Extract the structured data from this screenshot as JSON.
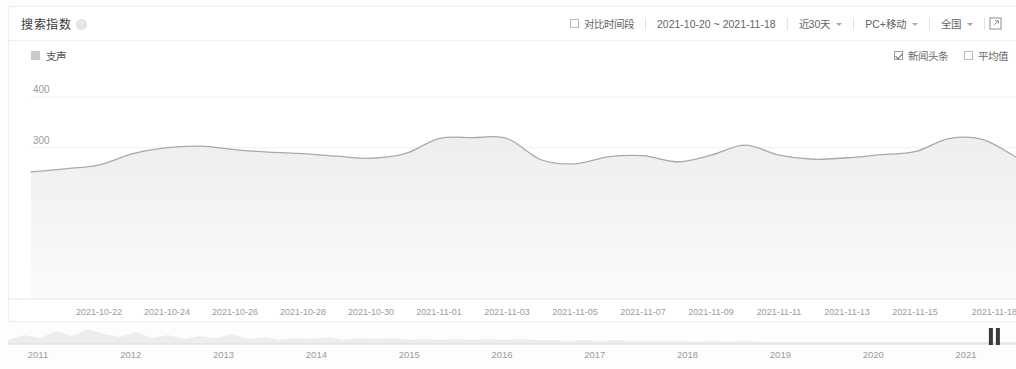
{
  "header": {
    "title": "搜索指数",
    "help_icon": "help-circle-icon",
    "compare_label": "对比时间段",
    "compare_checked": false,
    "date_range": "2021-10-20 ~ 2021-11-18",
    "period_label": "近30天",
    "device_label": "PC+移动",
    "region_label": "全国",
    "share_icon": "external-link-icon"
  },
  "legend": {
    "series_label": "支声",
    "news_label": "新闻头条",
    "news_checked": true,
    "average_label": "平均值",
    "average_checked": false
  },
  "colors": {
    "line": "#a9a9a9",
    "area_top": "#f2f2f2",
    "area_bottom": "#fafafa",
    "grid": "#f0f0f0",
    "axis_text": "#9b9b9b",
    "card_border": "#ececec"
  },
  "brush": {
    "years": [
      "2011",
      "2012",
      "2013",
      "2014",
      "2015",
      "2016",
      "2017",
      "2018",
      "2019",
      "2020",
      "2021"
    ],
    "handle_position_pct": 98.2
  },
  "chart_data": {
    "type": "area",
    "title": "搜索指数",
    "xlabel": "",
    "ylabel": "",
    "ylim": [
      0,
      440
    ],
    "grid": true,
    "legend_position": "top-left",
    "y_ticks": [
      100,
      200,
      300,
      400
    ],
    "x_tick_labels": [
      "2021-10-22",
      "2021-10-24",
      "2021-10-26",
      "2021-10-28",
      "2021-10-30",
      "2021-11-01",
      "2021-11-03",
      "2021-11-05",
      "2021-11-07",
      "2021-11-09",
      "2021-11-11",
      "2021-11-13",
      "2021-11-15",
      "2021-11-18"
    ],
    "series": [
      {
        "name": "支声",
        "x": [
          "2021-10-20",
          "2021-10-21",
          "2021-10-22",
          "2021-10-23",
          "2021-10-24",
          "2021-10-25",
          "2021-10-26",
          "2021-10-27",
          "2021-10-28",
          "2021-10-29",
          "2021-10-30",
          "2021-10-31",
          "2021-11-01",
          "2021-11-02",
          "2021-11-03",
          "2021-11-04",
          "2021-11-05",
          "2021-11-06",
          "2021-11-07",
          "2021-11-08",
          "2021-11-09",
          "2021-11-10",
          "2021-11-11",
          "2021-11-12",
          "2021-11-13",
          "2021-11-14",
          "2021-11-15",
          "2021-11-16",
          "2021-11-17",
          "2021-11-18"
        ],
        "values": [
          252,
          258,
          266,
          288,
          300,
          303,
          296,
          291,
          288,
          283,
          279,
          288,
          318,
          320,
          318,
          276,
          268,
          282,
          284,
          272,
          285,
          305,
          285,
          277,
          280,
          286,
          292,
          318,
          316,
          280
        ]
      }
    ]
  }
}
